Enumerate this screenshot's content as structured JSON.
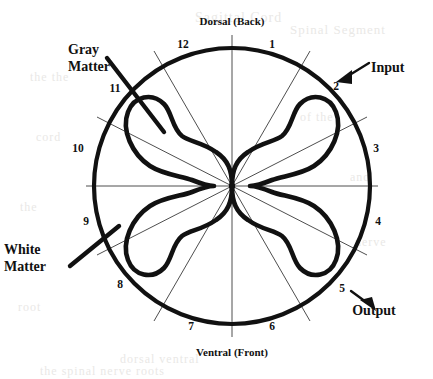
{
  "figure": {
    "title_top": "Dorsal (Back)",
    "title_bottom": "Ventral (Front)",
    "colors": {
      "ink": "#111111",
      "paper": "#ffffff",
      "thin_line": "#3a3a3a",
      "ghost": "#d8d6d2"
    },
    "geometry": {
      "center_x": 232,
      "center_y": 186,
      "outer_radius": 138
    }
  },
  "clock_positions": [
    {
      "n": "1",
      "x": 272,
      "y": 48
    },
    {
      "n": "2",
      "x": 336,
      "y": 90
    },
    {
      "n": "3",
      "x": 376,
      "y": 152
    },
    {
      "n": "4",
      "x": 378,
      "y": 225
    },
    {
      "n": "5",
      "x": 342,
      "y": 292
    },
    {
      "n": "6",
      "x": 272,
      "y": 330
    },
    {
      "n": "7",
      "x": 191,
      "y": 330
    },
    {
      "n": "8",
      "x": 120,
      "y": 288
    },
    {
      "n": "9",
      "x": 86,
      "y": 225
    },
    {
      "n": "10",
      "x": 78,
      "y": 152
    },
    {
      "n": "11",
      "x": 115,
      "y": 92
    },
    {
      "n": "12",
      "x": 183,
      "y": 48
    }
  ],
  "callouts": [
    {
      "id": "gray-matter",
      "line1": "Gray",
      "line2": "Matter",
      "label_x": 68,
      "label_y": 52,
      "pointer": {
        "x1": 107,
        "y1": 58,
        "x2": 164,
        "y2": 132
      }
    },
    {
      "id": "white-matter",
      "line1": "White",
      "line2": "Matter",
      "label_x": 4,
      "label_y": 252,
      "pointer": {
        "x1": 70,
        "y1": 266,
        "x2": 119,
        "y2": 226
      }
    },
    {
      "id": "input",
      "line1": "Input",
      "line2": "",
      "label_x": 371,
      "label_y": 72,
      "pointer": {
        "x1": 366,
        "y1": 65,
        "x2": 341,
        "y2": 80
      }
    },
    {
      "id": "output",
      "line1": "Output",
      "line2": "",
      "label_x": 374,
      "label_y": 315,
      "pointer": {
        "x1": 352,
        "y1": 292,
        "x2": 372,
        "y2": 308
      }
    }
  ],
  "ghost_text": [
    {
      "text": "Sagittal Cord",
      "x": 195,
      "y": 10,
      "size": 14
    },
    {
      "text": "Spinal Segment",
      "x": 290,
      "y": 22,
      "size": 13
    },
    {
      "text": "the the",
      "x": 30,
      "y": 70,
      "size": 12
    },
    {
      "text": "of the",
      "x": 300,
      "y": 110,
      "size": 12
    },
    {
      "text": "cord",
      "x": 36,
      "y": 130,
      "size": 12
    },
    {
      "text": "and",
      "x": 350,
      "y": 170,
      "size": 12
    },
    {
      "text": "the",
      "x": 20,
      "y": 200,
      "size": 12
    },
    {
      "text": "nerve",
      "x": 355,
      "y": 235,
      "size": 12
    },
    {
      "text": "root",
      "x": 18,
      "y": 300,
      "size": 12
    },
    {
      "text": "dorsal ventral",
      "x": 120,
      "y": 352,
      "size": 12
    },
    {
      "text": "the spinal nerve roots",
      "x": 40,
      "y": 364,
      "size": 12
    }
  ]
}
